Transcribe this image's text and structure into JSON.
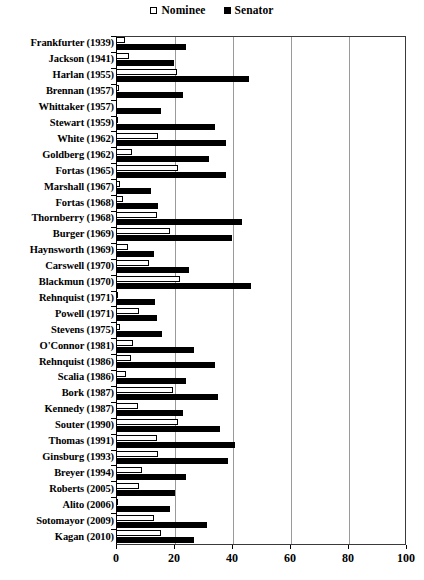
{
  "legend": {
    "position": "top-center",
    "entries": [
      {
        "label": "Nominee",
        "marker": "open-square-swatch",
        "color": "#ffffff"
      },
      {
        "label": "Senator",
        "marker": "filled-square-swatch",
        "color": "#000000"
      }
    ]
  },
  "chart_data": {
    "type": "bar",
    "orientation": "horizontal",
    "title": "",
    "subtitle": "",
    "xlabel": "",
    "ylabel": "",
    "xlim": [
      0,
      100
    ],
    "ylim": null,
    "grid": true,
    "grid_axis": "x",
    "xticks": [
      0,
      20,
      40,
      60,
      80,
      100
    ],
    "xticklabels": [
      "0",
      "20",
      "40",
      "60",
      "80",
      "100"
    ],
    "categories": [
      "Frankfurter (1939)",
      "Jackson (1941)",
      "Harlan (1955)",
      "Brennan (1957)",
      "Whittaker (1957)",
      "Stewart (1959)",
      "White (1962)",
      "Goldberg (1962)",
      "Fortas (1965)",
      "Marshall (1967)",
      "Fortas (1968)",
      "Thornberry (1968)",
      "Burger (1969)",
      "Haynsworth (1969)",
      "Carswell (1970)",
      "Blackmun (1970)",
      "Rehnquist (1971)",
      "Powell (1971)",
      "Stevens (1975)",
      "O'Connor (1981)",
      "Rehnquist (1986)",
      "Scalia (1986)",
      "Bork (1987)",
      "Kennedy (1987)",
      "Souter (1990)",
      "Thomas (1991)",
      "Ginsburg (1993)",
      "Breyer (1994)",
      "Roberts (2005)",
      "Alito (2006)",
      "Sotomayor (2009)",
      "Kagan (2010)"
    ],
    "series": [
      {
        "name": "Nominee",
        "color": "#ffffff",
        "values": [
          3,
          4.5,
          21,
          1,
          0,
          0.5,
          14.5,
          5.5,
          21.5,
          1.5,
          2.5,
          14,
          18.5,
          4,
          11.5,
          22,
          0.5,
          8,
          1.5,
          6,
          5,
          3.5,
          19.5,
          7.5,
          21.5,
          14,
          14.5,
          9,
          8,
          0.5,
          13,
          15.5
        ]
      },
      {
        "name": "Senator",
        "color": "#000000",
        "values": [
          24,
          20,
          46,
          23,
          15.5,
          34,
          38,
          32,
          38,
          12,
          14.5,
          43.5,
          40,
          13,
          25,
          46.5,
          13.5,
          14,
          16,
          27,
          34,
          24,
          35,
          23,
          36,
          41,
          38.5,
          24,
          20.5,
          18.5,
          31.5,
          27
        ]
      }
    ]
  }
}
